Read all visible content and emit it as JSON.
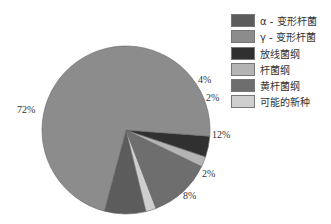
{
  "chart_data": {
    "type": "pie",
    "title": "",
    "categories": [
      "α - 变形杆菌",
      "γ - 变形杆菌",
      "放线菌纲",
      "杆菌纲",
      "黄杆菌纲",
      "可能的新种"
    ],
    "values": [
      8,
      72,
      4,
      2,
      12,
      2
    ],
    "labels": [
      "8%",
      "72%",
      "4%",
      "2%",
      "12%",
      "2%"
    ],
    "colors": [
      "#5c5c5c",
      "#8c8c8c",
      "#303030",
      "#b4b4b4",
      "#6e6e6e",
      "#cfcfcf"
    ],
    "legend_position": "right"
  },
  "legend": {
    "items": [
      {
        "label": "α - 变形杆菌",
        "color": "#5c5c5c"
      },
      {
        "label": "γ - 变形杆菌",
        "color": "#8c8c8c"
      },
      {
        "label": "放线菌纲",
        "color": "#303030"
      },
      {
        "label": "杆菌纲",
        "color": "#b4b4b4"
      },
      {
        "label": "黄杆菌纲",
        "color": "#6e6e6e"
      },
      {
        "label": "可能的新种",
        "color": "#cfcfcf"
      }
    ]
  },
  "slice_labels": {
    "gamma": "72%",
    "actino": "4%",
    "bacilli": "2%",
    "flavo": "12%",
    "novel": "2%",
    "alpha": "8%"
  }
}
